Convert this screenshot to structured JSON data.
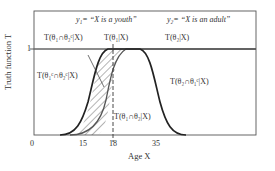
{
  "figure": {
    "y_axis_label": "Truth function T",
    "x_axis_label": "Age X",
    "y_tick_one": "1",
    "x_ticks": [
      "0",
      "15",
      "18",
      "35"
    ],
    "hypothesis_y1": "y₁= “X is a youth”",
    "hypothesis_y2": "y₂= “X is an adult”",
    "labels": {
      "t_theta1_and_not_theta2": "T(θ₁∩θ₂ᶜ|X)",
      "t_theta1": "T(θ₁|X)",
      "t_theta2": "T(θ₂|X)",
      "t_not_theta1_and_not_theta2": "T(θ₁ᶜ∩θ₂ᶜ|X)",
      "t_theta2_and_not_theta1": "T(θ₂∩θ₁ᶜ|X)",
      "t_theta1_and_theta2": "T(θ₁∩θ₂|X)"
    },
    "colors": {
      "frame": "#333333",
      "youth_curve": "#222222",
      "adult_curve": "#555555",
      "hatch": "#444444",
      "background": "#ffffff"
    }
  }
}
